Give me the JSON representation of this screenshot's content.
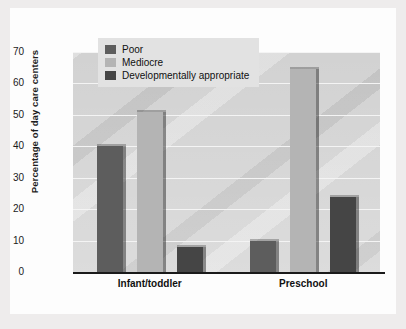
{
  "chart_data": {
    "type": "bar",
    "title": "",
    "xlabel": "",
    "ylabel": "Percentage of day care centers",
    "categories": [
      "Infant/toddler",
      "Preschool"
    ],
    "ylim": [
      0,
      70
    ],
    "yticks": [
      0,
      10,
      20,
      30,
      40,
      50,
      60,
      70
    ],
    "ytick_labels": [
      "0",
      "10",
      "20",
      "30",
      "40",
      "50",
      "60",
      "70"
    ],
    "grid": true,
    "legend_position": "top-left-inside",
    "series": [
      {
        "name": "Poor",
        "color": "#5d5d5d",
        "values": [
          40,
          10
        ]
      },
      {
        "name": "Mediocre",
        "color": "#b4b4b4",
        "values": [
          51,
          64.5
        ]
      },
      {
        "name": "Developmentally appropriate",
        "color": "#454545",
        "values": [
          8,
          24
        ]
      }
    ]
  },
  "legend": {
    "items": [
      {
        "label": "Poor",
        "color": "#5d5d5d"
      },
      {
        "label": "Mediocre",
        "color": "#b4b4b4"
      },
      {
        "label": "Developmentally appropriate",
        "color": "#454545"
      }
    ]
  },
  "axis": {
    "y_title": "Percentage of day care centers"
  }
}
